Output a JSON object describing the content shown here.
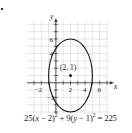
{
  "problem_marker": ".",
  "chart_data": {
    "type": "line",
    "title": "",
    "xlabel": "x",
    "ylabel": "y",
    "xlim": [
      -4,
      7
    ],
    "ylim": [
      -4,
      8
    ],
    "grid": true,
    "x_ticks": [
      -2,
      2,
      4,
      6
    ],
    "y_ticks": [
      -2,
      4,
      6
    ],
    "curve": {
      "kind": "ellipse",
      "equation": "25(x − 2)² + 9(y − 1)² = 225",
      "center": [
        2,
        1
      ],
      "semi_axis_x": 3,
      "semi_axis_y": 5
    },
    "points": [
      {
        "x": 2,
        "y": 1,
        "label": "(2, 1)"
      }
    ],
    "annotations": [
      "(2, 1)"
    ]
  },
  "equation": {
    "part1": "25(",
    "x": "x",
    "part2": " − 2)",
    "exp1": "2",
    "part3": " + 9(",
    "y": "y",
    "part4": " − 1)",
    "exp2": "2",
    "part5": " = 225"
  },
  "labels": {
    "x_axis": "x",
    "y_axis": "y",
    "center": "(2, 1)",
    "tick_neg2_x": "−2",
    "tick_2_x": "2",
    "tick_4_x": "4",
    "tick_6_x": "6",
    "tick_neg2_y": "−2",
    "tick_4_y": "4",
    "tick_6_y": "6"
  },
  "colors": {
    "grid": "#cfcfcf",
    "axis": "#333333",
    "curve": "#111111"
  }
}
